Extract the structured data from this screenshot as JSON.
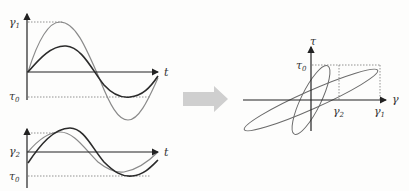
{
  "diagram": {
    "colors": {
      "axis": "#333333",
      "dark_curve": "#2b2b2b",
      "light_curve": "#8a8a8a",
      "dotted": "#777777",
      "arrow": "#cfcfcf",
      "background": "#fdfdfc"
    },
    "top_left_plot": {
      "y_labels": {
        "gamma1": "γ",
        "gamma1_sub": "1",
        "tau0": "τ",
        "tau0_sub": "0"
      },
      "x_label": "t",
      "curves": [
        "strain γ1 (light, large amplitude)",
        "stress τ (dark, smaller amplitude, phase-lagged)"
      ]
    },
    "bottom_left_plot": {
      "y_labels": {
        "gamma2": "γ",
        "gamma2_sub": "2",
        "tau0": "τ",
        "tau0_sub": "0"
      },
      "x_label": "t",
      "curves": [
        "strain γ2 (light)",
        "stress τ (dark, phase-lagged)"
      ]
    },
    "arrow": {
      "direction": "right",
      "label": ""
    },
    "right_plot": {
      "x_label": "γ",
      "y_label": "τ",
      "tick_labels": {
        "tau0": "τ",
        "tau0_sub": "0",
        "gamma2": "γ",
        "gamma2_sub": "2",
        "gamma1": "γ",
        "gamma1_sub": "1"
      },
      "loops": [
        "narrow steep ellipse (γ2)",
        "wide shallow ellipse (γ1)"
      ]
    }
  }
}
